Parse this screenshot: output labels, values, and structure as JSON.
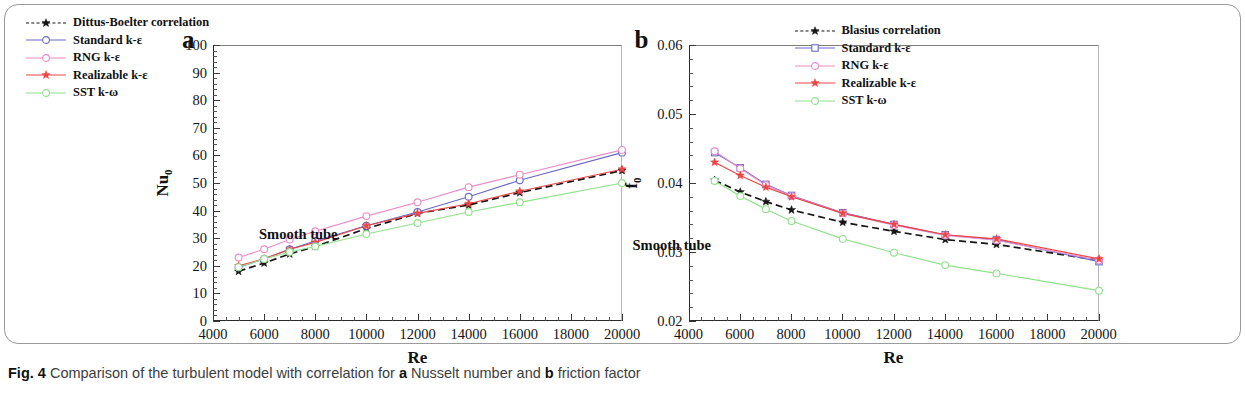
{
  "figure": {
    "caption_prefix": "Fig. 4",
    "caption_text": "Comparison of the turbulent model with correlation for",
    "caption_a_marker": "a",
    "caption_a_text": "Nusselt number and",
    "caption_b_marker": "b",
    "caption_b_text": "friction factor"
  },
  "colors": {
    "correlation": "#161616",
    "standard": "#6a6ac8",
    "rng": "#e98cc8",
    "realizable": "#ef4444",
    "sst": "#90e08c",
    "axis": "#2a2a2a",
    "frame": "#9a9a9a"
  },
  "panel_a": {
    "letter": "a",
    "annotation": "Smooth tube",
    "ylabel_main": "Nu",
    "ylabel_sub": "0",
    "xlabel": "Re"
  },
  "panel_b": {
    "letter": "b",
    "annotation": "Smooth tube",
    "ylabel_main": "f",
    "ylabel_sub": "0",
    "xlabel": "Re"
  },
  "chart_data": [
    {
      "type": "line",
      "panel": "a",
      "title": "Nusselt number vs Reynolds number (Smooth tube)",
      "xlabel": "Re",
      "ylabel": "Nu0",
      "xlim": [
        4000,
        20000
      ],
      "ylim": [
        0,
        100
      ],
      "xticks": [
        4000,
        6000,
        8000,
        10000,
        12000,
        14000,
        16000,
        18000,
        20000
      ],
      "xtick_labels": [
        "4000",
        "6000",
        "8000",
        "10000",
        "12000",
        "14000",
        "16000",
        "18000",
        "20000"
      ],
      "yticks": [
        0,
        10,
        20,
        30,
        40,
        50,
        60,
        70,
        80,
        90,
        100
      ],
      "ytick_labels": [
        "0",
        "10",
        "20",
        "30",
        "40",
        "50",
        "60",
        "70",
        "80",
        "90",
        "100"
      ],
      "x_minor_step": 500,
      "y_minor_step": 2,
      "grid": false,
      "legend_position": "upper-left",
      "annotation": "Smooth tube",
      "x": [
        5000,
        6000,
        7000,
        8000,
        10000,
        12000,
        14000,
        16000,
        20000
      ],
      "series": [
        {
          "name": "Dittus-Boelter correlation",
          "color": "#161616",
          "marker": "star-filled",
          "dash": "dashed",
          "values": [
            18.0,
            21.0,
            24.3,
            27.0,
            33.5,
            39.0,
            42.0,
            46.5,
            54.5
          ]
        },
        {
          "name": "Standard k-ε",
          "color": "#6a6ac8",
          "marker": "circle-open",
          "dash": "solid",
          "values": [
            19.5,
            22.5,
            26.0,
            29.0,
            34.5,
            39.5,
            45.0,
            51.0,
            61.0
          ]
        },
        {
          "name": "RNG k-ε",
          "color": "#e98cc8",
          "marker": "circle-open",
          "dash": "solid",
          "values": [
            23.0,
            26.0,
            29.5,
            32.5,
            38.0,
            43.0,
            48.5,
            53.0,
            62.0
          ]
        },
        {
          "name": "Realizable k-ε",
          "color": "#ef4444",
          "marker": "star-filled",
          "dash": "solid",
          "values": [
            20.0,
            22.5,
            26.0,
            28.5,
            34.5,
            39.0,
            42.5,
            47.0,
            55.0
          ]
        },
        {
          "name": "SST k-ω",
          "color": "#90e08c",
          "marker": "circle-open",
          "dash": "solid",
          "values": [
            19.5,
            22.5,
            25.0,
            27.0,
            31.5,
            35.5,
            39.5,
            43.0,
            50.0
          ]
        }
      ]
    },
    {
      "type": "line",
      "panel": "b",
      "title": "Friction factor vs Reynolds number (Smooth tube)",
      "xlabel": "Re",
      "ylabel": "f0",
      "xlim": [
        4000,
        20000
      ],
      "ylim": [
        0.02,
        0.06
      ],
      "xticks": [
        4000,
        6000,
        8000,
        10000,
        12000,
        14000,
        16000,
        18000,
        20000
      ],
      "xtick_labels": [
        "4000",
        "6000",
        "8000",
        "10000",
        "12000",
        "14000",
        "16000",
        "18000",
        "20000"
      ],
      "yticks": [
        0.02,
        0.03,
        0.04,
        0.05,
        0.06
      ],
      "ytick_labels": [
        "0.02",
        "0.03",
        "0.04",
        "0.05",
        "0.06"
      ],
      "x_minor_step": 500,
      "y_minor_step": 0.002,
      "grid": false,
      "legend_position": "upper-right",
      "annotation": "Smooth tube",
      "x": [
        5000,
        6000,
        7000,
        8000,
        10000,
        12000,
        14000,
        16000,
        20000
      ],
      "series": [
        {
          "name": "Blasius correlation",
          "color": "#161616",
          "marker": "star-filled",
          "dash": "dashed",
          "values": [
            0.0404,
            0.0387,
            0.0373,
            0.0361,
            0.0343,
            0.033,
            0.0318,
            0.0311,
            0.0288
          ]
        },
        {
          "name": "Standard k-ε",
          "color": "#6a6ac8",
          "marker": "square-open",
          "dash": "solid",
          "values": [
            0.0444,
            0.0422,
            0.0398,
            0.0382,
            0.0357,
            0.034,
            0.0325,
            0.0318,
            0.0286
          ]
        },
        {
          "name": "RNG k-ε",
          "color": "#e98cc8",
          "marker": "circle-open",
          "dash": "solid",
          "values": [
            0.0446,
            0.0421,
            0.0397,
            0.0381,
            0.0356,
            0.0339,
            0.0324,
            0.0317,
            0.0288
          ]
        },
        {
          "name": "Realizable k-ε",
          "color": "#ef4444",
          "marker": "star-filled",
          "dash": "solid",
          "values": [
            0.043,
            0.0411,
            0.0394,
            0.038,
            0.0356,
            0.034,
            0.0325,
            0.0319,
            0.029
          ]
        },
        {
          "name": "SST k-ω",
          "color": "#90e08c",
          "marker": "circle-open",
          "dash": "solid",
          "values": [
            0.0403,
            0.0381,
            0.0362,
            0.0345,
            0.0319,
            0.0299,
            0.0281,
            0.0269,
            0.0244
          ]
        }
      ]
    }
  ]
}
